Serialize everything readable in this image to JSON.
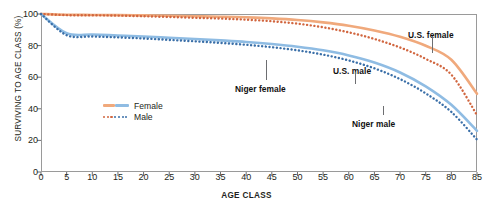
{
  "chart_data": {
    "type": "line",
    "title": "",
    "xlabel": "AGE CLASS",
    "ylabel": "SURVIVING TO AGE CLASS (%)",
    "xlim": [
      0,
      85
    ],
    "ylim": [
      0,
      100
    ],
    "grid": false,
    "legend_position": "inside-left-lower",
    "xticks": [
      "0",
      "5",
      "10",
      "15",
      "20",
      "25",
      "30",
      "35",
      "40",
      "45",
      "50",
      "55",
      "60",
      "65",
      "70",
      "75",
      "80",
      "85"
    ],
    "yticks": [
      "0",
      "20",
      "40",
      "60",
      "80",
      "100"
    ],
    "x": [
      0,
      5,
      10,
      15,
      20,
      25,
      30,
      35,
      40,
      45,
      50,
      55,
      60,
      65,
      70,
      75,
      80,
      85
    ],
    "series": [
      {
        "name": "U.S. female",
        "country": "U.S.",
        "sex": "female",
        "style": "solid",
        "color": "#F0A97C",
        "values": [
          100,
          99.5,
          99.4,
          99.3,
          99.1,
          98.9,
          98.6,
          98.3,
          97.9,
          97.2,
          96.2,
          94.7,
          92.6,
          89.6,
          85.6,
          79.9,
          71.0,
          49.5
        ]
      },
      {
        "name": "U.S. male",
        "country": "U.S.",
        "sex": "male",
        "style": "dotted",
        "color": "#D1663F",
        "values": [
          100,
          99.3,
          99.2,
          99.0,
          98.6,
          98.1,
          97.6,
          97.1,
          96.4,
          95.4,
          93.9,
          91.6,
          88.4,
          84.2,
          78.8,
          71.6,
          61.6,
          36.0
        ]
      },
      {
        "name": "Niger female",
        "country": "Niger",
        "sex": "female",
        "style": "solid",
        "color": "#8FBCE3",
        "values": [
          100,
          87.8,
          87.0,
          86.4,
          85.8,
          85.0,
          84.2,
          83.3,
          82.3,
          81.0,
          79.3,
          77.0,
          73.8,
          69.3,
          63.0,
          54.2,
          42.5,
          26.0
        ]
      },
      {
        "name": "Niger male",
        "country": "Niger",
        "sex": "male",
        "style": "dotted",
        "color": "#3A6FA8",
        "values": [
          100,
          86.6,
          85.8,
          85.2,
          84.5,
          83.6,
          82.7,
          81.7,
          80.5,
          79.0,
          77.0,
          74.3,
          70.6,
          65.6,
          58.8,
          49.8,
          38.0,
          20.5
        ]
      }
    ],
    "annotations": [
      {
        "label": "U.S. female",
        "x_px": 408,
        "y_px": 30
      },
      {
        "label": "U.S. male",
        "x_px": 333,
        "y_px": 66
      },
      {
        "label": "Niger female",
        "x_px": 235,
        "y_px": 84
      },
      {
        "label": "Niger male",
        "x_px": 352,
        "y_px": 119
      }
    ]
  },
  "legend": {
    "items": [
      {
        "label": "Female",
        "style": "solid",
        "color_left": "#F0A97C",
        "color_right": "#8FBCE3"
      },
      {
        "label": "Male",
        "style": "dotted",
        "color_left": "#D1663F",
        "color_right": "#3A6FA8"
      }
    ]
  },
  "axes": {
    "xlabel": "AGE CLASS",
    "ylabel": "SURVIVING TO AGE CLASS (%)"
  }
}
